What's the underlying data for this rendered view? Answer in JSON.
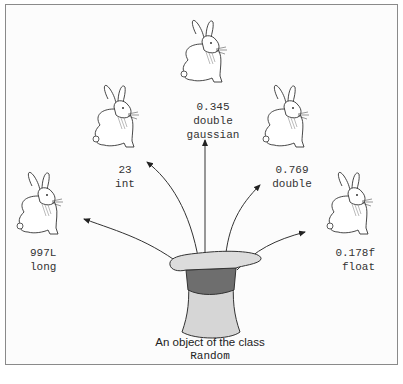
{
  "figure": {
    "source_object": {
      "line1": "An object of the class",
      "line2": "Random"
    },
    "rabbits": [
      {
        "id": "long",
        "value": "997L",
        "type": "long"
      },
      {
        "id": "int",
        "value": "23",
        "type": "int"
      },
      {
        "id": "gaussian",
        "value": "0.345",
        "type": "double",
        "type2": "gaussian"
      },
      {
        "id": "double",
        "value": "0.769",
        "type": "double"
      },
      {
        "id": "float",
        "value": "0.178f",
        "type": "float"
      }
    ],
    "colors": {
      "border": "#8a8a8a",
      "hat_light": "#d8d8d8",
      "hat_band": "#6e6e6e",
      "line": "#333333"
    }
  }
}
